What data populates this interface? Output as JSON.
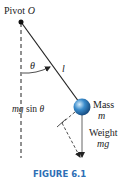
{
  "diagram": {
    "pivot_label": "Pivot ",
    "pivot_symbol": "O",
    "angle_label": "θ",
    "length_label": "l",
    "tangential_force_label_mg": "mg",
    "tangential_force_label_sin": " sin ",
    "tangential_force_label_theta": "θ",
    "mass_label": "Mass",
    "mass_symbol": "m",
    "weight_label": "Weight",
    "weight_symbol": "mg",
    "caption": "FIGURE 6.1",
    "colors": {
      "caption": "#2d6fb5",
      "ball_light": "#bfe0f5",
      "ball_mid": "#3a8ccc",
      "ball_dark": "#14477a",
      "line": "#222222"
    }
  }
}
